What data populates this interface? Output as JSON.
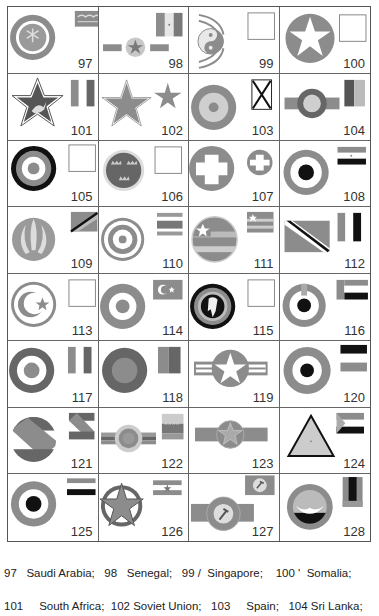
{
  "page": {
    "header_fragment": "",
    "colors": {
      "grey_dark": "#6e6e6e",
      "grey_mid": "#8c8c8c",
      "grey_light": "#b4b4b4",
      "grey_pale": "#cfcfcf",
      "black": "#111111",
      "border": "#666666"
    }
  },
  "cells": [
    {
      "number": "97",
      "icon": "saudi-arabia-roundel-icon"
    },
    {
      "number": "98",
      "icon": "senegal-roundel-icon"
    },
    {
      "number": "99",
      "icon": "singapore-roundel-icon"
    },
    {
      "number": "100",
      "icon": "somalia-roundel-icon"
    },
    {
      "number": "101",
      "icon": "south-africa-roundel-icon"
    },
    {
      "number": "102",
      "icon": "soviet-union-roundel-icon"
    },
    {
      "number": "103",
      "icon": "spain-roundel-icon"
    },
    {
      "number": "104",
      "icon": "sri-lanka-roundel-icon"
    },
    {
      "number": "105",
      "icon": "roundel-105-icon"
    },
    {
      "number": "106",
      "icon": "roundel-106-icon"
    },
    {
      "number": "107",
      "icon": "roundel-107-icon"
    },
    {
      "number": "108",
      "icon": "roundel-108-icon"
    },
    {
      "number": "109",
      "icon": "roundel-109-icon"
    },
    {
      "number": "110",
      "icon": "roundel-110-icon"
    },
    {
      "number": "111",
      "icon": "roundel-111-icon"
    },
    {
      "number": "112",
      "icon": "roundel-112-icon"
    },
    {
      "number": "113",
      "icon": "roundel-113-icon"
    },
    {
      "number": "114",
      "icon": "roundel-114-icon"
    },
    {
      "number": "115",
      "icon": "roundel-115-icon"
    },
    {
      "number": "116",
      "icon": "roundel-116-icon"
    },
    {
      "number": "117",
      "icon": "roundel-117-icon"
    },
    {
      "number": "118",
      "icon": "roundel-118-icon"
    },
    {
      "number": "119",
      "icon": "roundel-119-icon"
    },
    {
      "number": "120",
      "icon": "roundel-120-icon"
    },
    {
      "number": "121",
      "icon": "roundel-121-icon"
    },
    {
      "number": "122",
      "icon": "roundel-122-icon"
    },
    {
      "number": "123",
      "icon": "roundel-123-icon"
    },
    {
      "number": "124",
      "icon": "roundel-124-icon"
    },
    {
      "number": "125",
      "icon": "roundel-125-icon"
    },
    {
      "number": "126",
      "icon": "roundel-126-icon"
    },
    {
      "number": "127",
      "icon": "roundel-127-icon"
    },
    {
      "number": "128",
      "icon": "roundel-128-icon"
    }
  ],
  "caption": {
    "line1": "97   Saudi Arabia;   98   Senegal;   99 /  Singapore;    100 '  Somalia;",
    "line2": "101     South Africa;  102 Soviet Union;   103     Spain;   104 Sri Lanka;"
  }
}
